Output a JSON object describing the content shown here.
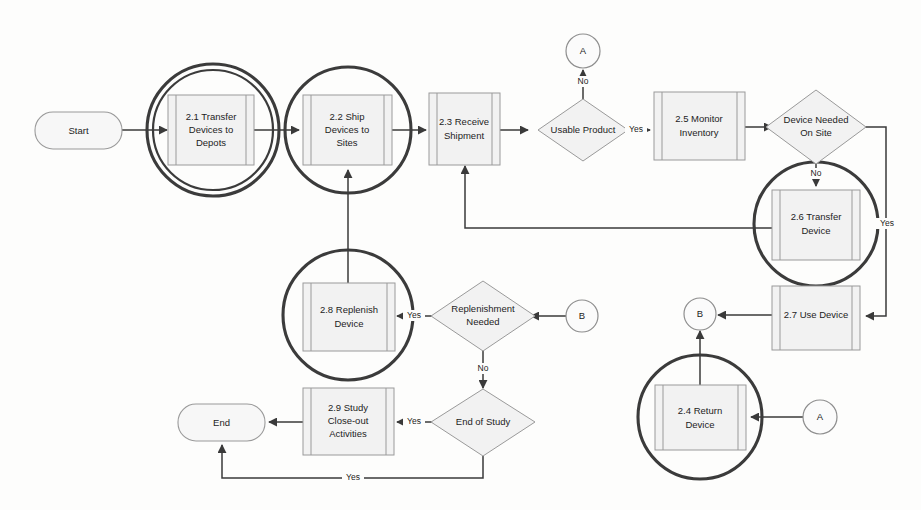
{
  "diagram": {
    "background_color": "#fdfdfc",
    "node_fill": "#f2f2f2",
    "node_stroke": "#9a9a9a",
    "link_color": "#3a3a3a",
    "highlight_circle_color": "#3b3b3b"
  },
  "nodes": {
    "start": {
      "label": "Start",
      "type": "terminator"
    },
    "n21": {
      "label_lines": [
        "2.1 Transfer",
        "Devices to",
        "Depots"
      ],
      "type": "predefined-process",
      "highlighted": "double-circle"
    },
    "n22": {
      "label_lines": [
        "2.2 Ship",
        "Devices to",
        "Sites"
      ],
      "type": "predefined-process",
      "highlighted": "circle"
    },
    "n23": {
      "label_lines": [
        "2.3 Receive",
        "Shipment"
      ],
      "type": "predefined-process",
      "highlighted": "none"
    },
    "usable": {
      "label_lines": [
        "Usable Product"
      ],
      "type": "decision"
    },
    "n25": {
      "label_lines": [
        "2.5 Monitor",
        "Inventory"
      ],
      "type": "predefined-process",
      "highlighted": "none"
    },
    "needed": {
      "label_lines": [
        "Device Needed",
        "On Site"
      ],
      "type": "decision"
    },
    "n26": {
      "label_lines": [
        "2.6 Transfer",
        "Device"
      ],
      "type": "predefined-process",
      "highlighted": "circle"
    },
    "n27": {
      "label_lines": [
        "2.7 Use Device"
      ],
      "type": "predefined-process",
      "highlighted": "none"
    },
    "n28": {
      "label_lines": [
        "2.8 Replenish",
        "Device"
      ],
      "type": "predefined-process",
      "highlighted": "circle"
    },
    "replenishment": {
      "label_lines": [
        "Replenishment",
        "Needed"
      ],
      "type": "decision"
    },
    "n24": {
      "label_lines": [
        "2.4 Return",
        "Device"
      ],
      "type": "predefined-process",
      "highlighted": "circle"
    },
    "endofstudy": {
      "label_lines": [
        "End of Study"
      ],
      "type": "decision"
    },
    "n29": {
      "label_lines": [
        "2.9 Study",
        "Close-out",
        "Activities"
      ],
      "type": "predefined-process",
      "highlighted": "none"
    },
    "end": {
      "label": "End",
      "type": "terminator"
    },
    "connA_top": {
      "label": "A",
      "type": "off-page-connector"
    },
    "connA_bottom": {
      "label": "A",
      "type": "off-page-connector"
    },
    "connB_mid": {
      "label": "B",
      "type": "off-page-connector"
    },
    "connB_right": {
      "label": "B",
      "type": "off-page-connector"
    }
  },
  "edge_labels": {
    "usable_no": "No",
    "usable_yes": "Yes",
    "needed_no": "No",
    "needed_yes": "Yes",
    "replenishment_yes": "Yes",
    "replenishment_no": "No",
    "endofstudy_yes": "Yes",
    "endofstudy_yes_bottom": "Yes"
  }
}
